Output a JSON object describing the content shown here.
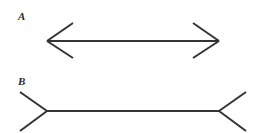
{
  "figure": {
    "background_color": "#ffffff",
    "line_color": "#333333",
    "label_color": "#2b2b2b",
    "stroke_width": 2,
    "width": 259,
    "height": 133,
    "panels": [
      {
        "id": "A",
        "label": "A",
        "label_x": 18,
        "label_y": 20,
        "description": "horizontal line with inward-pointing arrowheads at both ends",
        "fin_direction": "inward",
        "shaft": {
          "x1": 47,
          "y1": 41,
          "x2": 219,
          "y2": 41
        },
        "shaft_length": 172,
        "fins": [
          {
            "name": "left-upper",
            "x1": 47,
            "y1": 41,
            "x2": 73,
            "y2": 23
          },
          {
            "name": "left-lower",
            "x1": 47,
            "y1": 41,
            "x2": 73,
            "y2": 58
          },
          {
            "name": "right-upper",
            "x1": 219,
            "y1": 41,
            "x2": 193,
            "y2": 23
          },
          {
            "name": "right-lower",
            "x1": 219,
            "y1": 41,
            "x2": 193,
            "y2": 58
          }
        ]
      },
      {
        "id": "B",
        "label": "B",
        "label_x": 18,
        "label_y": 85,
        "description": "horizontal line with outward-pointing fins at both ends",
        "fin_direction": "outward",
        "shaft": {
          "x1": 47,
          "y1": 111,
          "x2": 219,
          "y2": 111
        },
        "shaft_length": 172,
        "fins": [
          {
            "name": "left-upper",
            "x1": 47,
            "y1": 111,
            "x2": 20,
            "y2": 92
          },
          {
            "name": "left-lower",
            "x1": 47,
            "y1": 111,
            "x2": 20,
            "y2": 131
          },
          {
            "name": "right-upper",
            "x1": 219,
            "y1": 111,
            "x2": 246,
            "y2": 92
          },
          {
            "name": "right-lower",
            "x1": 219,
            "y1": 111,
            "x2": 246,
            "y2": 131
          }
        ]
      }
    ]
  }
}
